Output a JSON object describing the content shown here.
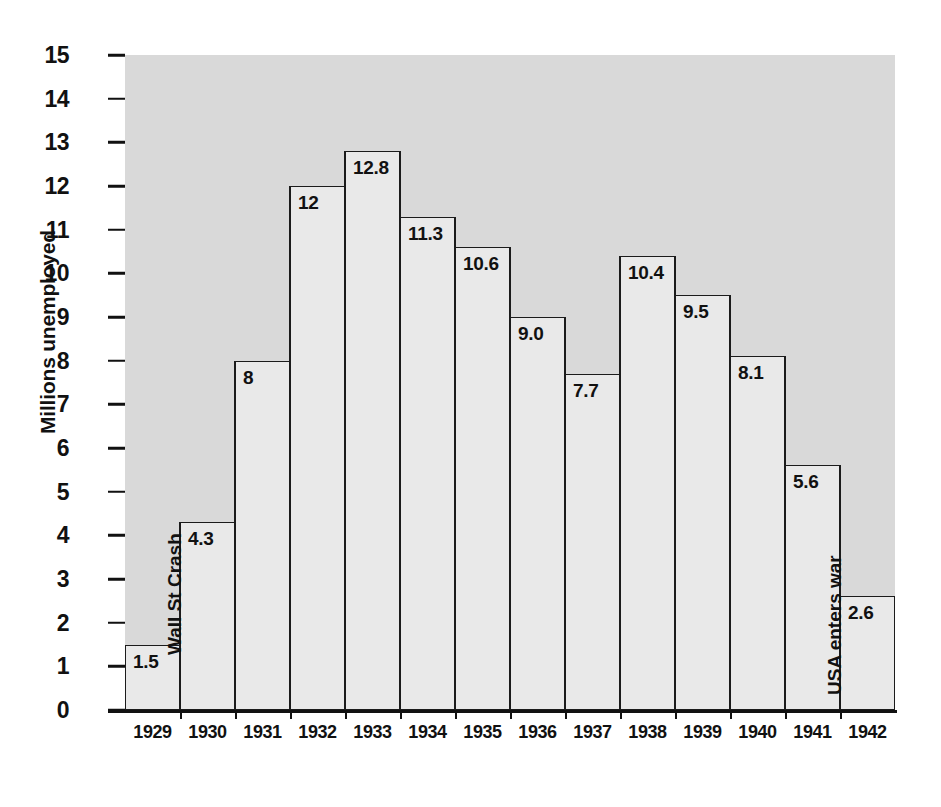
{
  "chart_data": {
    "type": "bar",
    "title": "",
    "xlabel": "",
    "ylabel": "Millions unemployed",
    "ylim": [
      0,
      15
    ],
    "ytick_step": 1,
    "grid": false,
    "legend": "none",
    "categories": [
      "1929",
      "1930",
      "1931",
      "1932",
      "1933",
      "1934",
      "1935",
      "1936",
      "1937",
      "1938",
      "1939",
      "1940",
      "1941",
      "1942"
    ],
    "values": [
      1.5,
      4.3,
      8,
      12,
      12.8,
      11.3,
      10.6,
      9.0,
      7.7,
      10.4,
      9.5,
      8.1,
      5.6,
      2.6
    ],
    "value_labels": [
      "1.5",
      "4.3",
      "8",
      "12",
      "12.8",
      "11.3",
      "10.6",
      "9.0",
      "7.7",
      "10.4",
      "9.5",
      "8.1",
      "5.6",
      "2.6"
    ],
    "ytick_labels": [
      "15",
      "14",
      "13",
      "12",
      "11",
      "10",
      "9",
      "8",
      "7",
      "6",
      "5",
      "4",
      "3",
      "2",
      "1",
      "0"
    ],
    "annotations": [
      {
        "text": "Wall St Crash",
        "category": "1929",
        "orientation": "vertical"
      },
      {
        "text": "USA enters war",
        "category": "1941",
        "orientation": "vertical"
      }
    ],
    "bands": [
      {
        "text": "Hoover president",
        "from": "1929",
        "to": "1932"
      },
      {
        "text": "Roosevelt president",
        "from": "1933",
        "to": "1942"
      }
    ],
    "colors": {
      "bar_fill": "#e9e9e9",
      "bar_border": "#1b1b1b",
      "plot_background": "#d9d9d9",
      "band_fill": "#f1f1f1",
      "text": "#111111",
      "page_background": "#ffffff"
    }
  }
}
